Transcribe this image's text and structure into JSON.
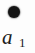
{
  "figure": {
    "name": "series-marker-legend-fragment",
    "background_color": "#fdfdfd",
    "marker": {
      "icon": "filled-circle-marker",
      "shape": "circle",
      "filled": true,
      "color": "#141414",
      "diameter_px": 12
    },
    "label": {
      "full_text": "a1",
      "base": "a",
      "subscript": "1",
      "color": "#1b1b1b",
      "style": "italic-serif"
    }
  }
}
